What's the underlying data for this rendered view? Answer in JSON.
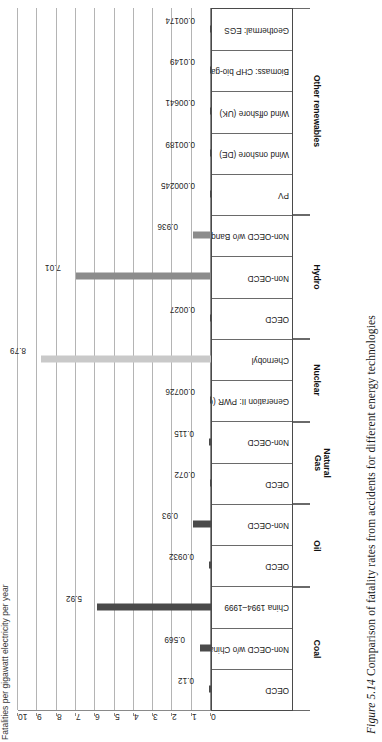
{
  "figure": {
    "number": "Figure 5.14",
    "caption": "Comparison of fatality rates from accidents for different energy technologies"
  },
  "chart_data": {
    "type": "bar",
    "title": "",
    "xlabel": "",
    "ylabel": "Fatalities per gigawatt electricity per year",
    "ylim": [
      0,
      10
    ],
    "yticks": [
      0,
      1,
      2,
      3,
      4,
      5,
      6,
      7,
      8,
      9,
      10
    ],
    "grid": true,
    "orientation": "vertical-bars-on-rotated-page",
    "legend": "none",
    "colors": {
      "dark": "#4a4a4a",
      "mid": "#8c8c8c",
      "light": "#c9c9c9",
      "gridline": "#b4b4b4",
      "axis": "#8a8a8a"
    },
    "categories": [
      "OECD",
      "Non-OECD w/o China",
      "China 1994–1999",
      "OECD",
      "Non-OECD",
      "OECD",
      "Non-OECD",
      "Generation II: PWR (CH)",
      "Chernobyl",
      "OECD",
      "Non-OECD",
      "Non-OECD w/o Banqiao/Shimantan",
      "PV",
      "Wind onshore (DE)",
      "Wind offshore (UK)",
      "Biomass: CHP bio-gas",
      "Geothermal: EGS"
    ],
    "values": [
      0.12,
      0.569,
      5.92,
      0.0932,
      0.93,
      0.072,
      0.115,
      0.00726,
      8.79,
      0.0027,
      7.01,
      0.936,
      0.000245,
      0.00189,
      0.00641,
      0.0149,
      0.00174
    ],
    "value_labels": [
      "0.12",
      "0.569",
      "5.92",
      "0.0932",
      "0.93",
      "0.072",
      "0.115",
      "0.00726",
      "8.79",
      "0.0027",
      "7.01",
      "0.936",
      "0.000245",
      "0.00189",
      "0.00641",
      "0.0149",
      "0.00174"
    ],
    "bar_shades": [
      "dark",
      "dark",
      "dark",
      "dark",
      "dark",
      "dark",
      "dark",
      "dark",
      "light",
      "dark",
      "mid",
      "mid",
      "dark",
      "dark",
      "dark",
      "dark",
      "dark"
    ],
    "groups": [
      {
        "label": "Coal",
        "start": 0,
        "end": 2
      },
      {
        "label": "Oil",
        "start": 3,
        "end": 4
      },
      {
        "label": "Natural Gas",
        "start": 5,
        "end": 6
      },
      {
        "label": "Nuclear",
        "start": 7,
        "end": 8
      },
      {
        "label": "Hydro",
        "start": 9,
        "end": 11
      },
      {
        "label": "Other renewables",
        "start": 12,
        "end": 16
      }
    ]
  }
}
